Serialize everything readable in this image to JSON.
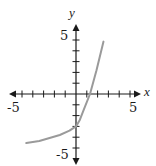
{
  "chart_data": {
    "type": "line",
    "title": "",
    "xlabel": "x",
    "ylabel": "y",
    "xlim": [
      -5,
      5
    ],
    "ylim": [
      -5,
      5
    ],
    "x_tick_labels": [
      "-5",
      "5"
    ],
    "y_tick_labels": [
      "5",
      "-5"
    ],
    "tick_step": 1,
    "grid": false,
    "legend": null,
    "series": [
      {
        "name": "curve",
        "color": "#9a9a9a",
        "points": [
          [
            -4.6,
            -4.55
          ],
          [
            -3.4,
            -4.35
          ],
          [
            -1.5,
            -3.8
          ],
          [
            -0.6,
            -3.4
          ],
          [
            0.0,
            -3.0
          ],
          [
            0.35,
            -2.4
          ],
          [
            0.7,
            -1.5
          ],
          [
            1.3,
            0.0
          ],
          [
            1.9,
            2.2
          ],
          [
            2.55,
            4.85
          ]
        ]
      }
    ],
    "annotations": {
      "y_intercept": -3,
      "x_intercept": 1.3
    }
  },
  "labels": {
    "x_axis": "x",
    "y_axis": "y",
    "x_min": "-5",
    "x_max": "5",
    "y_max": "5",
    "y_min": "-5"
  },
  "colors": {
    "axis": "#1a1a1a",
    "curve": "#9a9a9a"
  }
}
